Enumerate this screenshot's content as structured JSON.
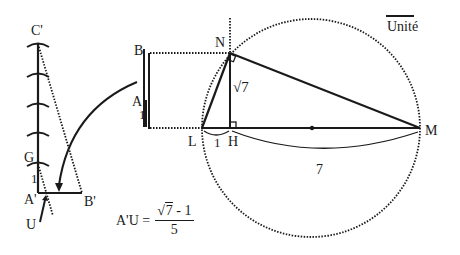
{
  "diagram": {
    "type": "geometric-construction",
    "legend": {
      "unit_label": "Unité"
    },
    "left_figure": {
      "points": [
        "C'",
        "G",
        "A'",
        "B'",
        "U"
      ],
      "segment_label": "1",
      "tick_count": 5
    },
    "middle_figure": {
      "points": [
        "B",
        "A"
      ],
      "segment_label": "1"
    },
    "right_figure": {
      "points": [
        "N",
        "L",
        "H",
        "M"
      ],
      "labels": {
        "NH": "√7",
        "LH": "1",
        "HM": "7"
      }
    },
    "formula": {
      "lhs": "A'U =",
      "sqrt_symbol": "√",
      "sqrt_arg": "7",
      "numerator_rest": " - 1",
      "denominator": "5"
    },
    "colors": {
      "ink": "#1a1a1a",
      "background": "#ffffff"
    }
  }
}
